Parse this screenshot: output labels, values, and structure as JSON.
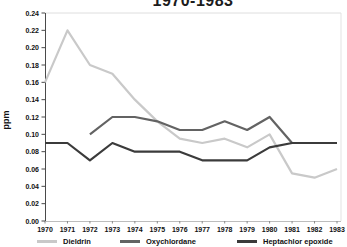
{
  "chart_data": {
    "type": "line",
    "title": "1970-1983",
    "title_note": "title partially cut off at top edge of image",
    "xlabel": "",
    "ylabel": "ppm",
    "categories": [
      "1970",
      "1971",
      "1972",
      "1973",
      "1974",
      "1975",
      "1976",
      "1977",
      "1978",
      "1979",
      "1980",
      "1981",
      "1982",
      "1983"
    ],
    "series": [
      {
        "name": "Dieldrin",
        "color": "#c9c9c9",
        "values": [
          0.16,
          0.22,
          0.18,
          0.17,
          0.14,
          0.115,
          0.095,
          0.09,
          0.095,
          0.085,
          0.1,
          0.055,
          0.05,
          0.06
        ]
      },
      {
        "name": "Oxychlordane",
        "color": "#636363",
        "values": [
          null,
          null,
          0.1,
          0.12,
          0.12,
          0.115,
          0.105,
          0.105,
          0.115,
          0.105,
          0.12,
          0.09,
          0.09,
          0.09
        ]
      },
      {
        "name": "Heptachlor epoxide",
        "color": "#3b3b3b",
        "values": [
          0.09,
          0.09,
          0.07,
          0.09,
          0.08,
          0.08,
          0.08,
          0.07,
          0.07,
          0.07,
          0.085,
          0.09,
          0.09,
          0.09
        ]
      }
    ],
    "ylim": [
      0.0,
      0.24
    ],
    "ytick_step": 0.02,
    "ytick_format": "0.00",
    "grid": "off",
    "frame": "light top and right border",
    "legend_position": "bottom"
  }
}
